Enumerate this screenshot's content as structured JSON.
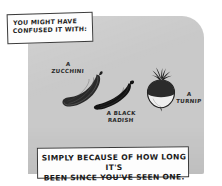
{
  "comic": {
    "speech_bubble": {
      "name": "speech-bubble",
      "text": "YOU MIGHT HAVE\nCONFUSED IT WITH:"
    },
    "caption": {
      "name": "caption-box",
      "text": "SIMPLY BECAUSE OF HOW LONG IT'S\nBEEN SINCE YOU'VE SEEN ONE."
    },
    "vegetables": [
      {
        "id": "zucchini",
        "label": "A\nZUCCHINI",
        "icon": "zucchini-icon",
        "color": "#2a2a2a"
      },
      {
        "id": "black-radish",
        "label": "A BLACK\nRADISH",
        "icon": "black-radish-icon",
        "color": "#1b1b1b"
      },
      {
        "id": "turnip",
        "label": "A\nTURNIP",
        "icon": "turnip-icon",
        "color": "#2b2b2b"
      }
    ],
    "colors": {
      "panel_background": "#c9c9c9",
      "page_background": "#ffffff",
      "ink": "#1d1d1d",
      "box_fill": "#fdfdfd"
    }
  }
}
